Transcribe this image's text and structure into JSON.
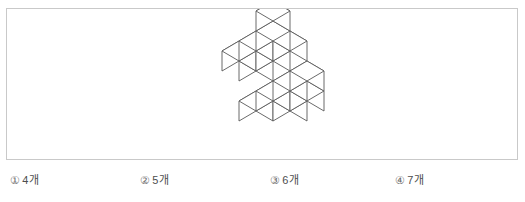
{
  "figure": {
    "name": "isometric-cube-stack",
    "line_color": "#595959",
    "face_colors": {
      "top": "#ffffff",
      "left": "#ffffff",
      "right": "#ffffff"
    },
    "projection": {
      "half_width": 17,
      "rise": 10,
      "height": 20,
      "origin_x": 76,
      "origin_y": 112
    },
    "cubes": [
      {
        "x": 0,
        "y": 2,
        "z": 1
      },
      {
        "x": 1,
        "y": 2,
        "z": 1
      },
      {
        "x": 2,
        "y": 2,
        "z": 1
      },
      {
        "x": 2,
        "y": 2,
        "z": 2
      },
      {
        "x": 0,
        "y": 1,
        "z": 1
      },
      {
        "x": 1,
        "y": 1,
        "z": 1
      },
      {
        "x": 2,
        "y": 1,
        "z": 1
      },
      {
        "x": -1,
        "y": 0,
        "z": 0
      },
      {
        "x": 0,
        "y": 0,
        "z": 0
      },
      {
        "x": 1,
        "y": 0,
        "z": 0
      },
      {
        "x": 2,
        "y": 0,
        "z": 0
      },
      {
        "x": 0,
        "y": -1,
        "z": 0
      },
      {
        "x": 1,
        "y": -1,
        "z": 0
      }
    ]
  },
  "options": {
    "items": [
      {
        "marker": "①",
        "text": "4개"
      },
      {
        "marker": "②",
        "text": "5개"
      },
      {
        "marker": "③",
        "text": "6개"
      },
      {
        "marker": "④",
        "text": "7개"
      }
    ]
  }
}
